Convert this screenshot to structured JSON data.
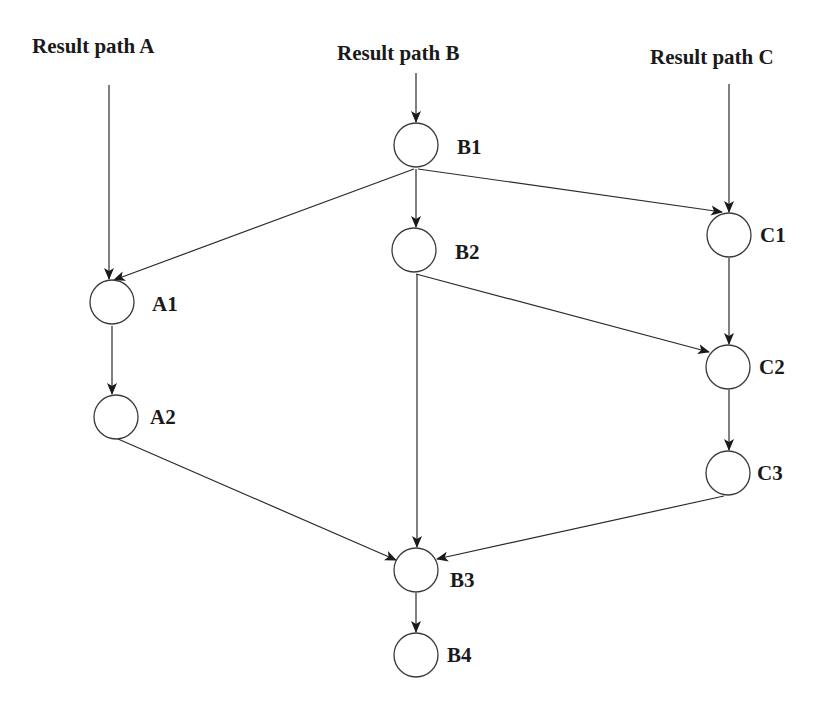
{
  "diagram": {
    "headers": [
      {
        "id": "A",
        "label": "Result path A",
        "x": 95,
        "y": 53
      },
      {
        "id": "B",
        "label": "Result path B",
        "x": 412,
        "y": 60
      },
      {
        "id": "C",
        "label": "Result path C",
        "x": 725,
        "y": 64
      }
    ],
    "nodes": [
      {
        "id": "B1",
        "label": "B1",
        "cx": 416,
        "cy": 145
      },
      {
        "id": "B2",
        "label": "B2",
        "cx": 414,
        "cy": 250
      },
      {
        "id": "A1",
        "label": "A1",
        "cx": 112,
        "cy": 302
      },
      {
        "id": "A2",
        "label": "A2",
        "cx": 116,
        "cy": 417
      },
      {
        "id": "C1",
        "label": "C1",
        "cx": 729,
        "cy": 235
      },
      {
        "id": "C2",
        "label": "C2",
        "cx": 728,
        "cy": 367
      },
      {
        "id": "C3",
        "label": "C3",
        "cx": 728,
        "cy": 473
      },
      {
        "id": "B3",
        "label": "B3",
        "cx": 416,
        "cy": 570
      },
      {
        "id": "B4",
        "label": "B4",
        "cx": 416,
        "cy": 655
      }
    ],
    "node_radius": 22,
    "edges": [
      {
        "from": "header-A",
        "to": "A1"
      },
      {
        "from": "header-B",
        "to": "B1"
      },
      {
        "from": "header-C",
        "to": "C1"
      },
      {
        "from": "B1",
        "to": "A1"
      },
      {
        "from": "B1",
        "to": "B2"
      },
      {
        "from": "B1",
        "to": "C1"
      },
      {
        "from": "B2",
        "to": "C2"
      },
      {
        "from": "B2",
        "to": "B3"
      },
      {
        "from": "A1",
        "to": "A2"
      },
      {
        "from": "A2",
        "to": "B3"
      },
      {
        "from": "C1",
        "to": "C2"
      },
      {
        "from": "C2",
        "to": "C3"
      },
      {
        "from": "C3",
        "to": "B3"
      },
      {
        "from": "B3",
        "to": "B4"
      }
    ],
    "colors": {
      "line": "#2a2a2a",
      "text": "#1a1a1a",
      "background": "#ffffff"
    }
  }
}
